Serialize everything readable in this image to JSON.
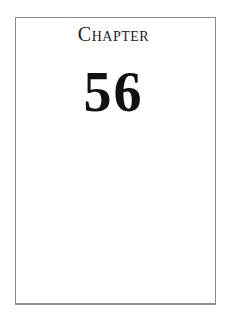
{
  "page": {
    "chapter_label": "Chapter",
    "chapter_number": "56"
  },
  "colors": {
    "border": "#8a8a8a",
    "text": "#111111",
    "background": "#ffffff"
  }
}
